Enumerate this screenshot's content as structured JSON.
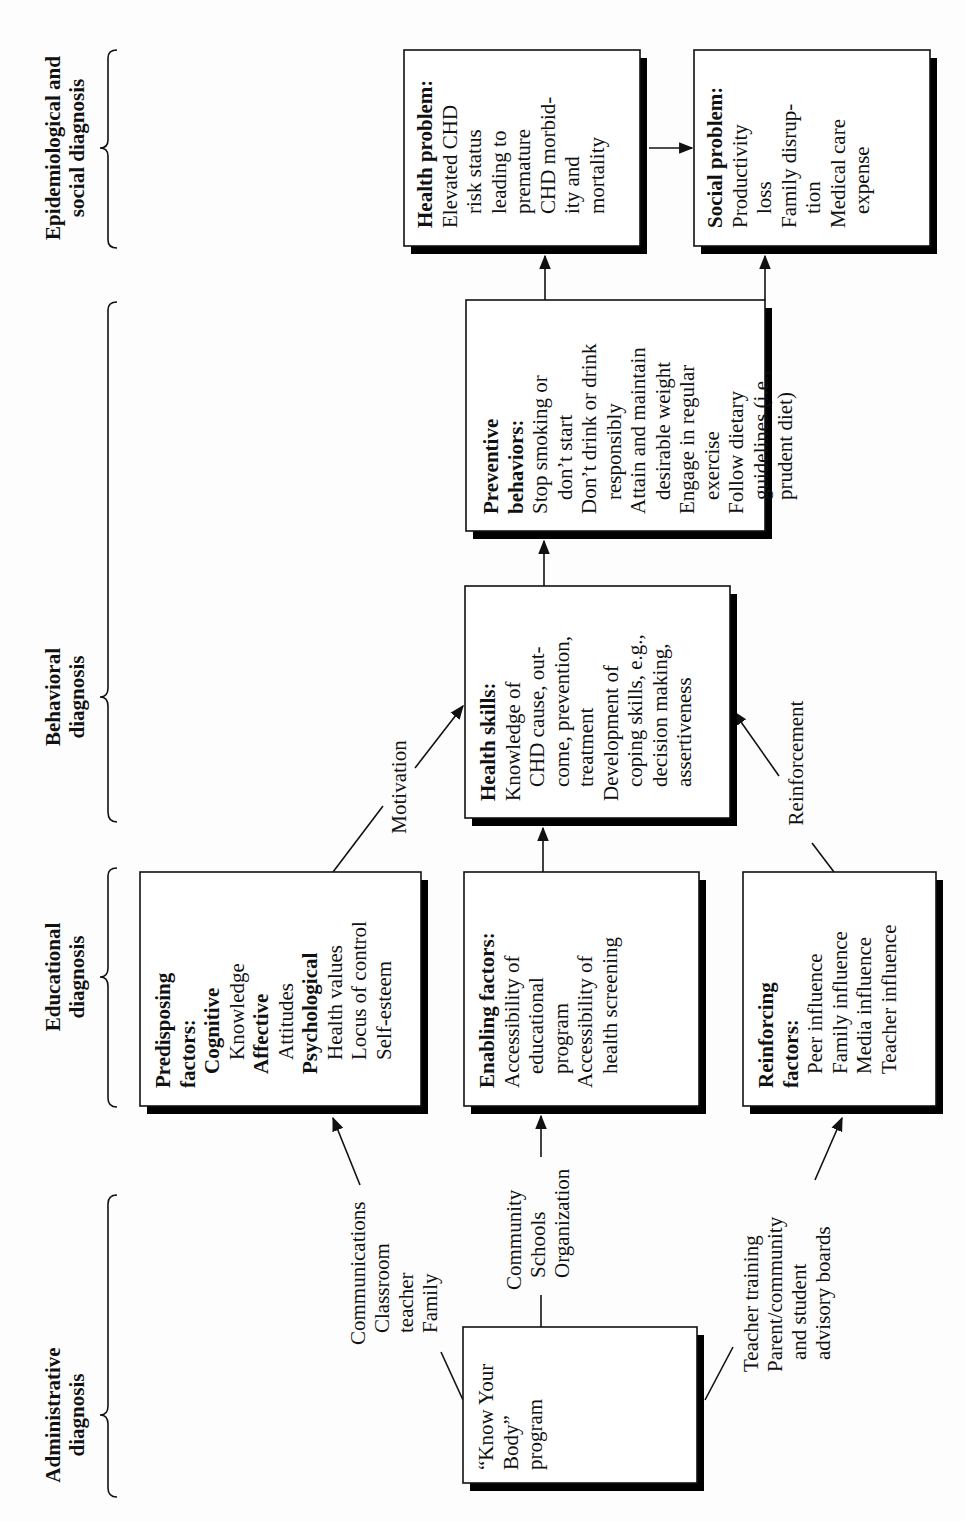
{
  "orientation": "rotated-90-ccw",
  "colors": {
    "line": "#111111",
    "shadow": "#000000",
    "box_fill": "#ffffff",
    "background": "#fdfdfd"
  },
  "stages": [
    {
      "id": "epidemiological",
      "lines": [
        "Epidemiological and",
        "social diagnosis"
      ]
    },
    {
      "id": "behavioral",
      "lines": [
        "Behavioral",
        "diagnosis"
      ]
    },
    {
      "id": "educational",
      "lines": [
        "Educational",
        "diagnosis"
      ]
    },
    {
      "id": "administrative",
      "lines": [
        "Administrative",
        "diagnosis"
      ]
    }
  ],
  "boxes": {
    "health_problem": {
      "title": "Health problem:",
      "lines": [
        {
          "text": "Elevated CHD",
          "indent": 0
        },
        {
          "text": "risk status",
          "indent": 1
        },
        {
          "text": "leading to",
          "indent": 1
        },
        {
          "text": "premature",
          "indent": 1
        },
        {
          "text": "CHD morbid-",
          "indent": 1
        },
        {
          "text": "ity and",
          "indent": 1
        },
        {
          "text": "mortality",
          "indent": 1
        }
      ]
    },
    "social_problem": {
      "title": "Social problem:",
      "lines": [
        {
          "text": "Productivity",
          "indent": 0
        },
        {
          "text": "loss",
          "indent": 1
        },
        {
          "text": "Family disrup-",
          "indent": 0
        },
        {
          "text": "tion",
          "indent": 1
        },
        {
          "text": "Medical care",
          "indent": 0
        },
        {
          "text": "expense",
          "indent": 1
        }
      ]
    },
    "preventive_behaviors": {
      "title_lines": [
        "Preventive",
        "behaviors:"
      ],
      "lines": [
        {
          "text": "Stop smoking or",
          "indent": 0
        },
        {
          "text": "don’t start",
          "indent": 1
        },
        {
          "text": "Don’t drink or drink",
          "indent": 0
        },
        {
          "text": "responsibly",
          "indent": 1
        },
        {
          "text": "Attain and maintain",
          "indent": 0
        },
        {
          "text": "desirable weight",
          "indent": 1
        },
        {
          "text": "Engage in regular",
          "indent": 0
        },
        {
          "text": "exercise",
          "indent": 1
        },
        {
          "text": "Follow dietary",
          "indent": 0
        },
        {
          "text": "guidelines (i.e.,",
          "indent": 1
        },
        {
          "text": "prudent diet)",
          "indent": 1
        }
      ]
    },
    "health_skills": {
      "title": "Health skills:",
      "lines": [
        {
          "text": "Knowledge of",
          "indent": 0
        },
        {
          "text": "CHD cause, out-",
          "indent": 1
        },
        {
          "text": "come, prevention,",
          "indent": 1
        },
        {
          "text": "treatment",
          "indent": 1
        },
        {
          "text": "Development of",
          "indent": 0
        },
        {
          "text": "coping skills, e.g.,",
          "indent": 1
        },
        {
          "text": "decision making,",
          "indent": 1
        },
        {
          "text": "assertiveness",
          "indent": 1
        }
      ]
    },
    "predisposing": {
      "title_lines": [
        "Predisposing",
        "factors:"
      ],
      "lines": [
        {
          "text": "Cognitive",
          "indent": 1,
          "bold": true
        },
        {
          "text": "Knowledge",
          "indent": 2
        },
        {
          "text": "Affective",
          "indent": 1,
          "bold": true
        },
        {
          "text": "Attitudes",
          "indent": 2
        },
        {
          "text": "Psychological",
          "indent": 1,
          "bold": true
        },
        {
          "text": "Health values",
          "indent": 2
        },
        {
          "text": "Locus of control",
          "indent": 2
        },
        {
          "text": "Self-esteem",
          "indent": 2
        }
      ]
    },
    "enabling": {
      "title": "Enabling factors:",
      "lines": [
        {
          "text": "Accessibility of",
          "indent": 0
        },
        {
          "text": "educational",
          "indent": 1
        },
        {
          "text": "program",
          "indent": 1
        },
        {
          "text": "Accessibility of",
          "indent": 0
        },
        {
          "text": "health screening",
          "indent": 1
        }
      ]
    },
    "reinforcing": {
      "title_lines": [
        "Reinforcing",
        "factors:"
      ],
      "lines": [
        {
          "text": "Peer influence",
          "indent": 1
        },
        {
          "text": "Family influence",
          "indent": 1
        },
        {
          "text": "Media influence",
          "indent": 1
        },
        {
          "text": "Teacher influence",
          "indent": 1
        }
      ]
    },
    "know_your_body": {
      "lines": [
        "“Know Your",
        "Body”",
        "program"
      ]
    }
  },
  "connector_labels": {
    "motivation": "Motivation",
    "reinforcement": "Reinforcement",
    "communications": [
      "Communications",
      "Classroom",
      "teacher",
      "Family"
    ],
    "community": [
      "Community",
      "Schools",
      "Organization"
    ],
    "teacher_training": [
      "Teacher training",
      "Parent/community",
      "and student",
      "advisory boards"
    ]
  }
}
